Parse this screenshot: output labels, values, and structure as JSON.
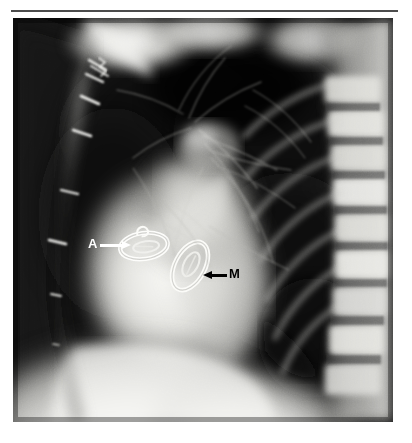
{
  "figure": {
    "type": "lateral-chest-radiograph",
    "modality": "plain film radiograph",
    "projection": "lateral",
    "separator_rule_color": "#4c4c4c",
    "background_color": "#ffffff",
    "film_background_color": "#0d0d0d"
  },
  "annotations": [
    {
      "id": "aortic",
      "label": "A",
      "meaning": "aortic valve prosthesis",
      "label_color": "#ffffff",
      "arrow_color": "#ffffff",
      "arrow_direction": "right",
      "label_x": 75,
      "label_y": 219,
      "arrow_x": 87,
      "arrow_y": 226,
      "arrow_length": 30
    },
    {
      "id": "mitral",
      "label": "M",
      "meaning": "mitral valve prosthesis",
      "label_color": "#000000",
      "arrow_color": "#000000",
      "arrow_direction": "left",
      "label_x": 216,
      "label_y": 249,
      "arrow_x": 190,
      "arrow_y": 256,
      "arrow_length": 24
    }
  ],
  "radiograph_features": {
    "prostheses": [
      {
        "name": "aortic-valve-ring",
        "shape": "ellipse",
        "cx": 131,
        "cy": 228,
        "rx": 24,
        "ry": 13,
        "rotation_deg": -8,
        "ring_color": "#f7f7f3"
      },
      {
        "name": "mitral-valve-ring",
        "shape": "ellipse",
        "cx": 177,
        "cy": 248,
        "rx": 16,
        "ry": 26,
        "rotation_deg": 28,
        "ring_color": "#f2f2ee"
      }
    ],
    "sternal_wires": [
      {
        "x": 75,
        "y": 56,
        "length": 17,
        "angle_deg": 30
      },
      {
        "x": 70,
        "y": 78,
        "length": 16,
        "angle_deg": 28
      },
      {
        "x": 62,
        "y": 112,
        "length": 16,
        "angle_deg": 22
      },
      {
        "x": 50,
        "y": 172,
        "length": 15,
        "angle_deg": 16
      },
      {
        "x": 38,
        "y": 222,
        "length": 15,
        "angle_deg": 10
      },
      {
        "x": 40,
        "y": 276,
        "length": 9,
        "angle_deg": 6
      }
    ],
    "regions": [
      {
        "name": "anterior-chest-wall",
        "density": "dark"
      },
      {
        "name": "retrosternal-lung",
        "density": "dark"
      },
      {
        "name": "cardiac-silhouette",
        "density": "bright"
      },
      {
        "name": "thoracic-vertebrae",
        "density": "bright"
      },
      {
        "name": "posterior-costophrenic-recess",
        "density": "dark"
      },
      {
        "name": "diaphragm-and-upper-abdomen",
        "density": "bright"
      }
    ]
  }
}
